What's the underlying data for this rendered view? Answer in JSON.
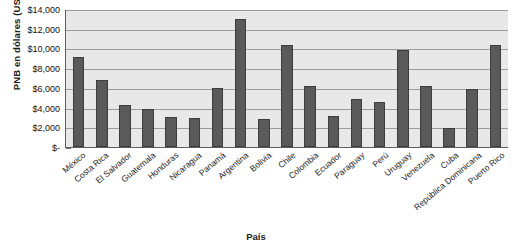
{
  "chart_data": {
    "type": "bar",
    "title": "",
    "xlabel": "País",
    "ylabel": "PNB en dólares (USD)",
    "ylim": [
      0,
      14000
    ],
    "ytick_labels": [
      "$14,000",
      "$12,000",
      "$10,000",
      "$8,000",
      "$6,000",
      "$4,000",
      "$2,000",
      "$-"
    ],
    "ytick_values": [
      14000,
      12000,
      10000,
      8000,
      6000,
      4000,
      2000,
      0
    ],
    "grid": true,
    "legend": "none",
    "categories": [
      "México",
      "Costa Rica",
      "El Salvador",
      "Guatemala",
      "Honduras",
      "Nicaragua",
      "Panamá",
      "Argentina",
      "Bolivia",
      "Chile",
      "Colombia",
      "Ecuador",
      "Paraguay",
      "Perú",
      "Uruguay",
      "Venezuela",
      "Cuba",
      "República Dominicana",
      "Puerto Rico"
    ],
    "values": [
      9100,
      6800,
      4300,
      3900,
      3000,
      2900,
      6000,
      13000,
      2800,
      10300,
      6200,
      3100,
      4900,
      4600,
      9800,
      6200,
      1900,
      5900,
      10300
    ],
    "colors": {
      "bar_fill": "#5a5a5a",
      "bar_border": "#3d3d3d",
      "plot_background": "#e8e8e8",
      "gridline": "#9b9b9b",
      "axis_line": "#5d5d5d",
      "text": "#1a1a1a"
    }
  }
}
